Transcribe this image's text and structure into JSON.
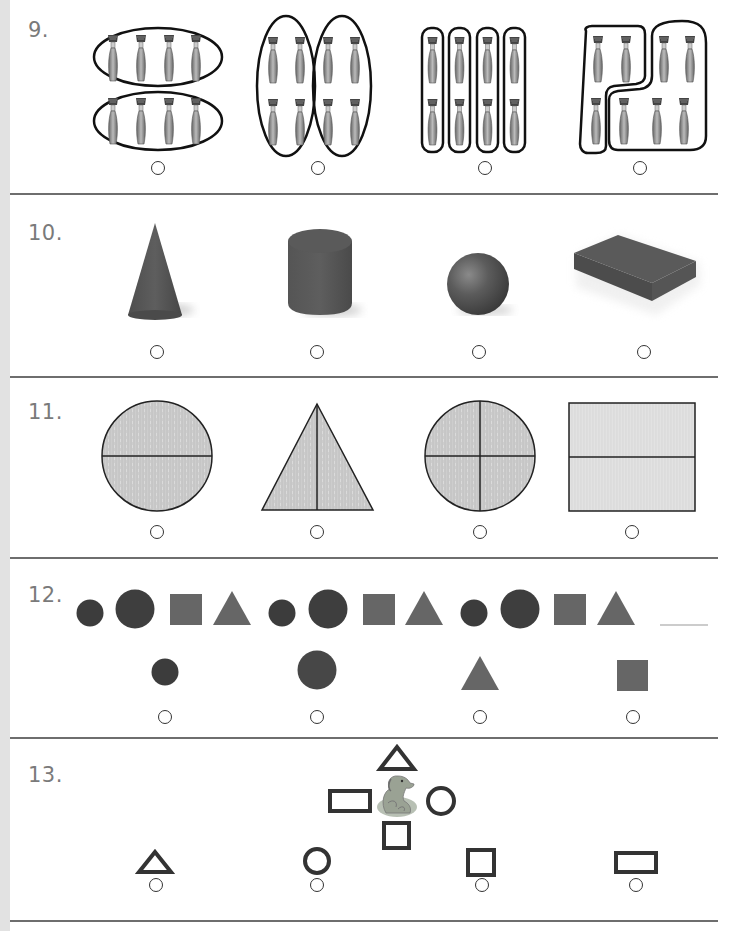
{
  "page": {
    "colors": {
      "outline": "#1a1a1a",
      "dark_shape": "#3c3c3c",
      "mid_shape": "#6a6a6a",
      "solid_3d": "#555555",
      "texture_fill": "#cfcfcf",
      "rule": "#6e6e6e",
      "number": "#7a7a7a"
    },
    "questions": [
      {
        "number": "9.",
        "type": "grouping",
        "options": [
          {
            "id": "a",
            "description": "8 paintbrushes grouped into 2 horizontal groups of 4"
          },
          {
            "id": "b",
            "description": "8 paintbrushes grouped into 2 vertical groups of 4"
          },
          {
            "id": "c",
            "description": "8 paintbrushes grouped into 4 groups of 2"
          },
          {
            "id": "d",
            "description": "8 paintbrushes grouped into a group of 3 and a group of 5"
          }
        ]
      },
      {
        "number": "10.",
        "type": "solid-figures",
        "options": [
          {
            "id": "a",
            "description": "cone"
          },
          {
            "id": "b",
            "description": "cylinder"
          },
          {
            "id": "c",
            "description": "sphere"
          },
          {
            "id": "d",
            "description": "rectangular prism"
          }
        ]
      },
      {
        "number": "11.",
        "type": "equal-parts",
        "options": [
          {
            "id": "a",
            "description": "circle divided into 2 halves"
          },
          {
            "id": "b",
            "description": "triangle divided into 2 halves"
          },
          {
            "id": "c",
            "description": "circle divided into 4 fourths"
          },
          {
            "id": "d",
            "description": "rectangle divided into 2 halves"
          }
        ]
      },
      {
        "number": "12.",
        "type": "pattern",
        "sequence": [
          "small-circle",
          "large-circle",
          "square",
          "triangle",
          "small-circle",
          "large-circle",
          "square",
          "triangle",
          "small-circle",
          "large-circle",
          "square",
          "triangle",
          "blank"
        ],
        "options": [
          {
            "id": "a",
            "description": "small circle"
          },
          {
            "id": "b",
            "description": "large circle"
          },
          {
            "id": "c",
            "description": "triangle"
          },
          {
            "id": "d",
            "description": "square"
          }
        ]
      },
      {
        "number": "13.",
        "type": "position",
        "center_picture": "dog",
        "around": {
          "above": "triangle",
          "left": "rectangle",
          "right": "circle",
          "below": "square"
        },
        "options": [
          {
            "id": "a",
            "description": "triangle"
          },
          {
            "id": "b",
            "description": "circle"
          },
          {
            "id": "c",
            "description": "square"
          },
          {
            "id": "d",
            "description": "rectangle"
          }
        ]
      }
    ]
  }
}
